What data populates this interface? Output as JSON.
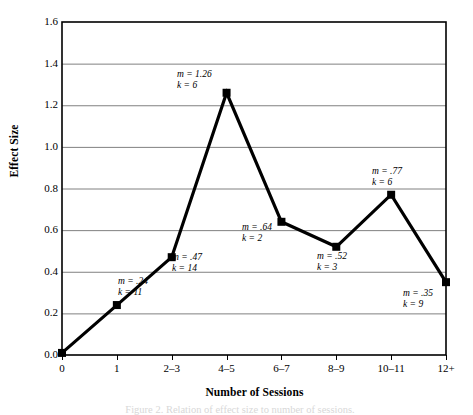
{
  "figure": {
    "caption_partial": "Figure 2. Relation of effect size to number of sessions."
  },
  "chart_data": {
    "type": "line",
    "title": "",
    "xlabel": "Number of Sessions",
    "ylabel": "Effect Size",
    "categories": [
      "0",
      "1",
      "2–3",
      "4–5",
      "6–7",
      "8–9",
      "10–11",
      "12+"
    ],
    "values": [
      0.01,
      0.24,
      0.47,
      1.26,
      0.64,
      0.52,
      0.77,
      0.35
    ],
    "ylim": [
      0.0,
      1.6
    ],
    "ytick_labels": [
      "1.6",
      "1.4",
      "1.2",
      "1.0",
      "0.8",
      "0.6",
      "0.4",
      "0.2",
      "0.0"
    ],
    "ytick_values": [
      1.6,
      1.4,
      1.2,
      1.0,
      0.8,
      0.6,
      0.4,
      0.2,
      0.0
    ],
    "grid": true,
    "grid_color": "#808080",
    "legend": "none",
    "line_color": "#000000",
    "marker": "square",
    "marker_color": "#000000",
    "annotations": [
      {
        "index": 1,
        "m": "m = .24",
        "k": "k = 11",
        "x": 118,
        "y": 276
      },
      {
        "index": 2,
        "m": "m = .47",
        "k": "k = 14",
        "x": 172,
        "y": 252
      },
      {
        "index": 3,
        "m": "m = 1.26",
        "k": "k = 6",
        "x": 177,
        "y": 69
      },
      {
        "index": 4,
        "m": "m = .64",
        "k": "k = 2",
        "x": 242,
        "y": 222
      },
      {
        "index": 5,
        "m": "m = .52",
        "k": "k = 3",
        "x": 317,
        "y": 251
      },
      {
        "index": 6,
        "m": "m = .77",
        "k": "k = 6",
        "x": 372,
        "y": 166
      },
      {
        "index": 7,
        "m": "m = .35",
        "k": "k = 9",
        "x": 403,
        "y": 288
      }
    ]
  },
  "axes": {
    "plot_left": 62,
    "plot_top": 22,
    "plot_right": 446,
    "plot_bottom": 355
  }
}
